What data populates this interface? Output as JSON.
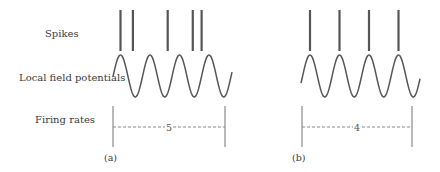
{
  "row_labels": {
    "spikes": "Spikes",
    "lfp": "Local field potentials",
    "firing_rates": "Firing rates"
  },
  "panels": [
    {
      "id": "a",
      "label": "(a)",
      "lfp_cycles": 4,
      "spike_phases": [
        0.0,
        0.42,
        1.6,
        2.45,
        2.75
      ],
      "spike_count": 5,
      "firing_rate_label": "5"
    },
    {
      "id": "b",
      "label": "(b)",
      "lfp_cycles": 4,
      "spike_phases": [
        0.0,
        1.0,
        2.0,
        3.0
      ],
      "spike_count": 4,
      "firing_rate_label": "4"
    }
  ],
  "colors": {
    "ink": "#555555",
    "text": "#3a3a3a",
    "guide": "#8a8a8a"
  }
}
